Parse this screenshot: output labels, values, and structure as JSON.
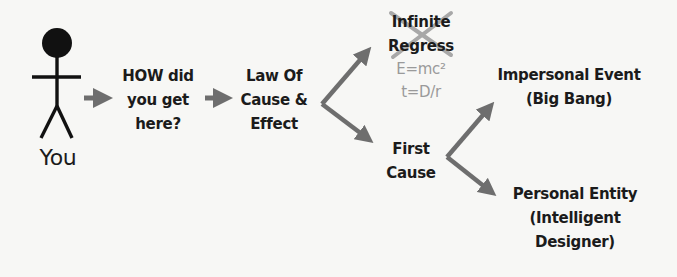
{
  "diagram": {
    "type": "flowchart",
    "colors": {
      "background": "#f7f7f5",
      "text": "#1b1b1b",
      "arrow": "#6e6e6e",
      "muted_text": "#9a9a9a",
      "strike_x": "#a8a8a8"
    },
    "nodes": {
      "you": {
        "icon": "stick-figure-icon",
        "label": "You"
      },
      "how": {
        "lines": [
          "HOW did",
          "you get",
          "here?"
        ]
      },
      "law": {
        "lines": [
          "Law Of",
          "Cause &",
          "Effect"
        ]
      },
      "infinite": {
        "lines": [
          "Infinite",
          "Regress"
        ],
        "crossed_out": true,
        "examples": [
          "E=mc²",
          "t=D/r"
        ]
      },
      "first": {
        "lines": [
          "First",
          "Cause"
        ]
      },
      "impersonal": {
        "lines": [
          "Impersonal Event",
          "(Big Bang)"
        ]
      },
      "personal": {
        "lines": [
          "Personal Entity",
          "(Intelligent",
          "Designer)"
        ]
      }
    },
    "edges": [
      {
        "from": "you",
        "to": "how"
      },
      {
        "from": "how",
        "to": "law"
      },
      {
        "from": "law",
        "to": "infinite"
      },
      {
        "from": "law",
        "to": "first"
      },
      {
        "from": "first",
        "to": "impersonal"
      },
      {
        "from": "first",
        "to": "personal"
      }
    ]
  }
}
